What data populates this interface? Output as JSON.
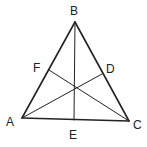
{
  "diagram": {
    "type": "triangle-with-cevians",
    "stroke_color": "#222222",
    "points": {
      "A": {
        "label": "A",
        "x": 22,
        "y": 118
      },
      "B": {
        "label": "B",
        "x": 75,
        "y": 22
      },
      "C": {
        "label": "C",
        "x": 129,
        "y": 121
      },
      "D": {
        "label": "D",
        "x": 102,
        "y": 74
      },
      "E": {
        "label": "E",
        "x": 74,
        "y": 120
      },
      "F": {
        "label": "F",
        "x": 49,
        "y": 70
      }
    },
    "segments": [
      "AB",
      "BC",
      "CA",
      "BE",
      "AD",
      "CF"
    ]
  }
}
